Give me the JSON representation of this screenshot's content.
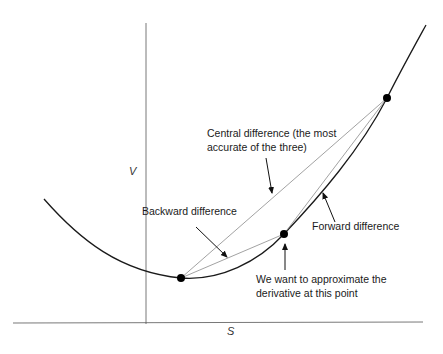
{
  "axes": {
    "x_label": "S",
    "y_label": "V"
  },
  "points": {
    "backward": {
      "x": 181,
      "y": 278
    },
    "target": {
      "x": 284,
      "y": 234
    },
    "forward": {
      "x": 387,
      "y": 98
    }
  },
  "annotations": {
    "central": {
      "line1": "Central difference (the most",
      "line2": "accurate of the three)"
    },
    "backward": "Backward difference",
    "forward": "Forward difference",
    "target": {
      "line1": "We want to approximate the",
      "line2": "derivative at this point"
    }
  },
  "colors": {
    "curve": "#1a1a1a",
    "secant": "#8a8a8a",
    "axis": "#555555",
    "point": "#000000"
  }
}
